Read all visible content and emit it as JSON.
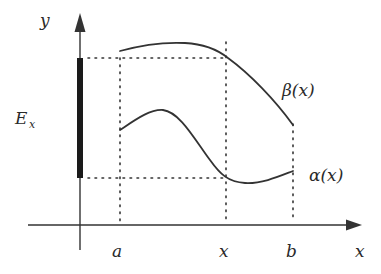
{
  "diagram": {
    "labels": {
      "y_axis": "y",
      "x_axis": "x",
      "set_main": "E",
      "set_sub": "x",
      "tick_a": "a",
      "tick_x": "x",
      "tick_b": "b",
      "upper_curve": "β(x)",
      "lower_curve": "α(x)"
    },
    "colors": {
      "ink": "#333333",
      "set_bar": "#1a1a1a",
      "background": "#ffffff"
    },
    "geometry": {
      "origin_x": 80,
      "x_axis_y": 225,
      "x_axis_start": 28,
      "x_axis_end": 360,
      "y_axis_top": 14,
      "y_axis_bottom": 250,
      "a_x": 120,
      "x_x": 226,
      "b_x": 293,
      "beta_at_x_y": 58,
      "alpha_at_x_y": 178,
      "set_bar_top": 58,
      "set_bar_bottom": 178
    }
  }
}
